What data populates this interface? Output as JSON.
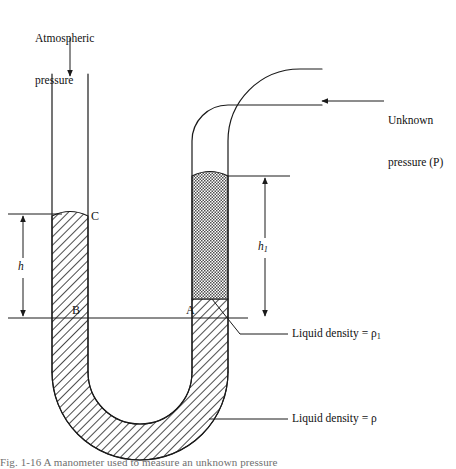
{
  "figure": {
    "type": "physics-diagram",
    "width": 456,
    "height": 469,
    "background_color": "#ffffff",
    "line_color": "#1a1a1a",
    "hatch_color": "#2b2b2b"
  },
  "labels": {
    "atmospheric_pressure_line1": "Atmospheric",
    "atmospheric_pressure_line2": "pressure",
    "unknown_pressure_line1": "Unknown",
    "unknown_pressure_line2": "pressure (P)",
    "point_a": "A",
    "point_b": "B",
    "point_c": "C",
    "height_h": "h",
    "height_h1_base": "h",
    "height_h1_sub": "1",
    "liquid_density_rho1_text": "Liquid density = ",
    "liquid_density_rho1_symbol": "ρ",
    "liquid_density_rho1_sub": "1",
    "liquid_density_rho_text": "Liquid density = ",
    "liquid_density_rho_symbol": "ρ",
    "caption_partial": "Fig. 1-16  A manometer used to measure an unknown pressure"
  },
  "annotations": {
    "atmospheric_arrow": {
      "direction": "down",
      "from_x": 70,
      "from_y": 38,
      "to_x": 70,
      "to_y": 74
    },
    "unknown_pressure_arrow": {
      "direction": "left",
      "from_x": 382,
      "from_y": 101,
      "to_x": 322,
      "to_y": 101
    },
    "h_dimension": {
      "label": "h",
      "x": 23,
      "top_y": 214,
      "bottom_y": 318,
      "arrowheads": "both"
    },
    "h1_dimension": {
      "label": "h1",
      "x": 265,
      "top_y": 176,
      "bottom_y": 318,
      "arrowheads": "both"
    },
    "datum_line": {
      "from_x": 8,
      "to_x": 248,
      "y": 318,
      "description": "horizontal reference line through A and B"
    }
  },
  "geometry": {
    "left_tube": {
      "outer_left": 52,
      "outer_right": 88,
      "top_y": 74,
      "liquid_top_y": 216,
      "wall_thickness": 17
    },
    "right_tube": {
      "outer_left": 192,
      "outer_right": 228,
      "liquid_rho1_top_y": 176,
      "bend_radius": 36,
      "horizontal_end_x": 322
    },
    "u_bend": {
      "center_x": 140,
      "center_y": 390,
      "outer_radius": 88
    }
  },
  "legend_leaders": {
    "rho1_leader": {
      "start_x": 212,
      "start_y": 299,
      "bend_x": 240,
      "bend_y": 333,
      "end_x": 288,
      "end_y": 333
    },
    "rho_leader": {
      "start_x": 213,
      "start_y": 419,
      "end_x": 288,
      "end_y": 419
    }
  },
  "colors": {
    "stroke": "#1a1a1a",
    "fine_hatch": "#4a4a4a",
    "coarse_hatch": "#2b2b2b",
    "text": "#111111",
    "caption": "#6f6f6f"
  }
}
